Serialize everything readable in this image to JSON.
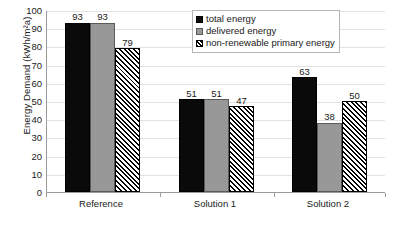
{
  "chart_data": {
    "type": "bar",
    "title": "",
    "xlabel": "",
    "ylabel": "Energy Demand (kWh/m²a)",
    "ylim": [
      0,
      100
    ],
    "ytick_step": 10,
    "yticks": [
      "100",
      "90",
      "80",
      "70",
      "60",
      "50",
      "40",
      "30",
      "20",
      "10",
      "0"
    ],
    "categories": [
      "Reference",
      "Solution 1",
      "Solution 2"
    ],
    "grid": "horizontal",
    "legend_position": "top-right",
    "series": [
      {
        "name": "total energy",
        "style": "solid-black",
        "color": "#0a0a0a",
        "values": [
          93,
          51,
          63
        ]
      },
      {
        "name": "delivered energy",
        "style": "solid-gray",
        "color": "#989898",
        "values": [
          93,
          51,
          38
        ]
      },
      {
        "name": "non-renewable primary energy",
        "style": "diagonal-hatch",
        "color": "#000000",
        "values": [
          79,
          47,
          50
        ]
      }
    ],
    "data_labels": {
      "Reference": [
        "93",
        "93",
        "79"
      ],
      "Solution 1": [
        "51",
        "51",
        "47"
      ],
      "Solution 2": [
        "63",
        "38",
        "50"
      ]
    }
  },
  "axis": {
    "y_title": "Energy Demand (kWh/m²a)"
  },
  "legend": {
    "items": [
      {
        "label": "total energy"
      },
      {
        "label": "delivered energy"
      },
      {
        "label": "non-renewable primary energy"
      }
    ]
  }
}
